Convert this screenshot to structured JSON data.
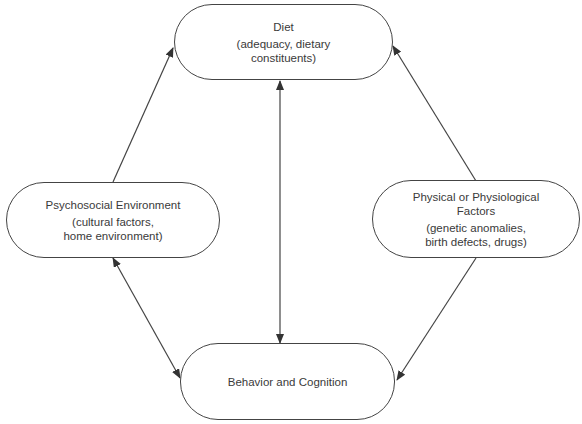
{
  "diagram": {
    "nodes": {
      "diet": {
        "title": "Diet",
        "line2": "(adequacy, dietary",
        "line3": "constituents)"
      },
      "psychosocial": {
        "title": "Psychosocial Environment",
        "line2": "(cultural factors,",
        "line3": "home environment)"
      },
      "physical": {
        "title": "Physical or Physiological",
        "title2": "Factors",
        "line2": "(genetic anomalies,",
        "line3": "birth defects, drugs)"
      },
      "behavior": {
        "title": "Behavior and Cognition"
      }
    },
    "edges": [
      {
        "from": "Psychosocial Environment",
        "to": "Diet",
        "direction": "one-way"
      },
      {
        "from": "Physical or Physiological Factors",
        "to": "Diet",
        "direction": "one-way"
      },
      {
        "from": "Physical or Physiological Factors",
        "to": "Behavior and Cognition",
        "direction": "one-way"
      },
      {
        "from": "Psychosocial Environment",
        "to": "Behavior and Cognition",
        "direction": "two-way"
      },
      {
        "from": "Diet",
        "to": "Behavior and Cognition",
        "direction": "two-way"
      }
    ],
    "colors": {
      "stroke": "#444444",
      "text": "#3a3a3a",
      "background": "#ffffff"
    }
  }
}
